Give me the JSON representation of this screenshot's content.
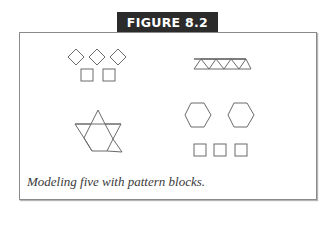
{
  "figure": {
    "label": "FIGURE 8.2",
    "caption": "Modeling five with pattern blocks.",
    "colors": {
      "tab_bg": "#2b2b2b",
      "tab_text": "#ffffff",
      "border": "#8a8a8a",
      "stroke": "#6a6a6a"
    }
  },
  "models": [
    {
      "id": "rhombi-and-squares",
      "description": "3 tan rhombi and 2 squares"
    },
    {
      "id": "triangles-row",
      "description": "row of 5 triangles forming a trapezoid strip"
    },
    {
      "id": "star",
      "description": "hexagon with triangles forming a star-like shape"
    },
    {
      "id": "hexagons-and-squares",
      "description": "2 hexagons and 3 squares"
    }
  ]
}
